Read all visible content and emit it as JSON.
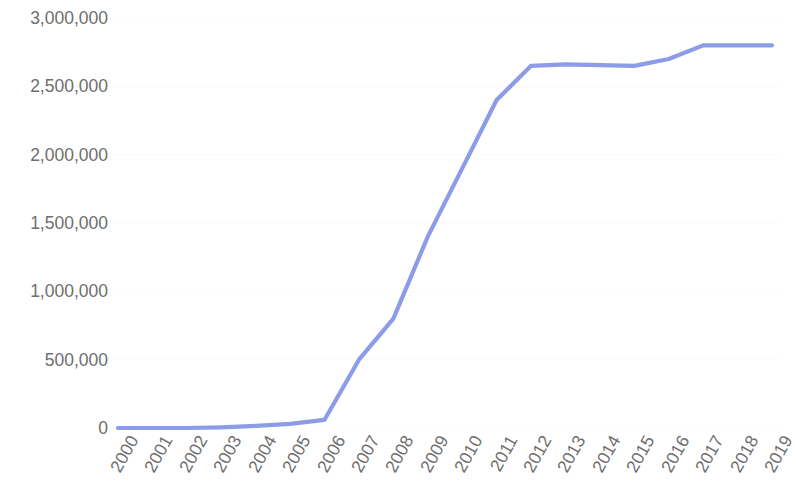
{
  "chart_data": {
    "type": "line",
    "title": "",
    "subtitle": "",
    "xlabel": "",
    "ylabel": "",
    "categories": [
      "2000",
      "2001",
      "2002",
      "2003",
      "2004",
      "2005",
      "2006",
      "2007",
      "2008",
      "2009",
      "2010",
      "2011",
      "2012",
      "2013",
      "2014",
      "2015",
      "2016",
      "2017",
      "2018",
      "2019"
    ],
    "series": [
      {
        "name": "",
        "color": "#8c9ce8",
        "values": [
          0,
          0,
          0,
          5000,
          15000,
          30000,
          60000,
          500000,
          800000,
          1400000,
          1900000,
          2400000,
          2650000,
          2660000,
          2655000,
          2650000,
          2700000,
          2800000,
          2800000,
          2800000
        ]
      }
    ],
    "ylim": [
      0,
      3000000
    ],
    "y_ticks": [
      0,
      500000,
      1000000,
      1500000,
      2000000,
      2500000,
      3000000
    ],
    "y_tick_labels": [
      "0",
      "500,000",
      "1,000,000",
      "1,500,000",
      "2,000,000",
      "2,500,000",
      "3,000,000"
    ],
    "grid": true,
    "grid_color": "#fbfbfb",
    "legend": false,
    "legend_position": "none",
    "axis_label_color": "#6e6e6e",
    "background_color": "#ffffff",
    "x_tick_rotation": -61
  }
}
